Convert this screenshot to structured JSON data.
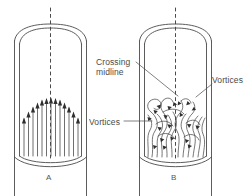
{
  "figure": {
    "type": "scientific-diagram",
    "background": "#ffffff",
    "line_color": "#4a4a4a",
    "text_color": "#4a4a4a"
  },
  "labels": {
    "crossing_midline": "Crossing\nmidline",
    "vortices_right": "Vortices",
    "vortices_left": "Vortices"
  },
  "panels": [
    {
      "id": "A",
      "letter": "A",
      "flow": "laminar",
      "arrow_count": 13,
      "arrow_direction": "up"
    },
    {
      "id": "B",
      "letter": "B",
      "flow": "turbulent",
      "arrow_direction": "swirling"
    }
  ],
  "midline": {
    "style": "dashed",
    "orientation": "vertical"
  }
}
